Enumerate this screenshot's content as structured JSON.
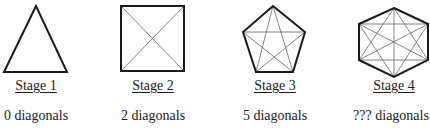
{
  "figure": {
    "stages": [
      {
        "label": "Stage 1",
        "shape": "triangle",
        "sides": 3,
        "diagonals_text": "0 diagonals",
        "diagonals": 0
      },
      {
        "label": "Stage 2",
        "shape": "square",
        "sides": 4,
        "diagonals_text": "2 diagonals",
        "diagonals": 2
      },
      {
        "label": "Stage 3",
        "shape": "pentagon",
        "sides": 5,
        "diagonals_text": "5 diagonals",
        "diagonals": 5
      },
      {
        "label": "Stage 4",
        "shape": "hexagon",
        "sides": 6,
        "diagonals_text": "??? diagonals",
        "diagonals": null
      }
    ],
    "colors": {
      "outline": "#1a1a1a",
      "diagonal": "#555555",
      "background": "#ffffff"
    }
  }
}
